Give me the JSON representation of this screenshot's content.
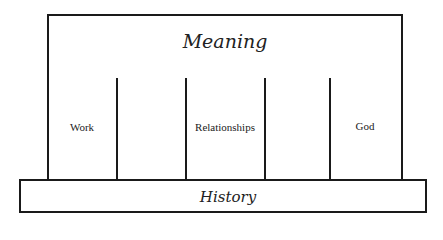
{
  "diagram": {
    "roof": {
      "label": "Meaning"
    },
    "pillars": [
      {
        "label": "Work"
      },
      {
        "label": ""
      },
      {
        "label": "Relationships"
      },
      {
        "label": ""
      },
      {
        "label": "God"
      }
    ],
    "foundation": {
      "label": "History"
    },
    "colors": {
      "line": "#1a1a1a",
      "text": "#222222",
      "background": "#ffffff"
    }
  }
}
